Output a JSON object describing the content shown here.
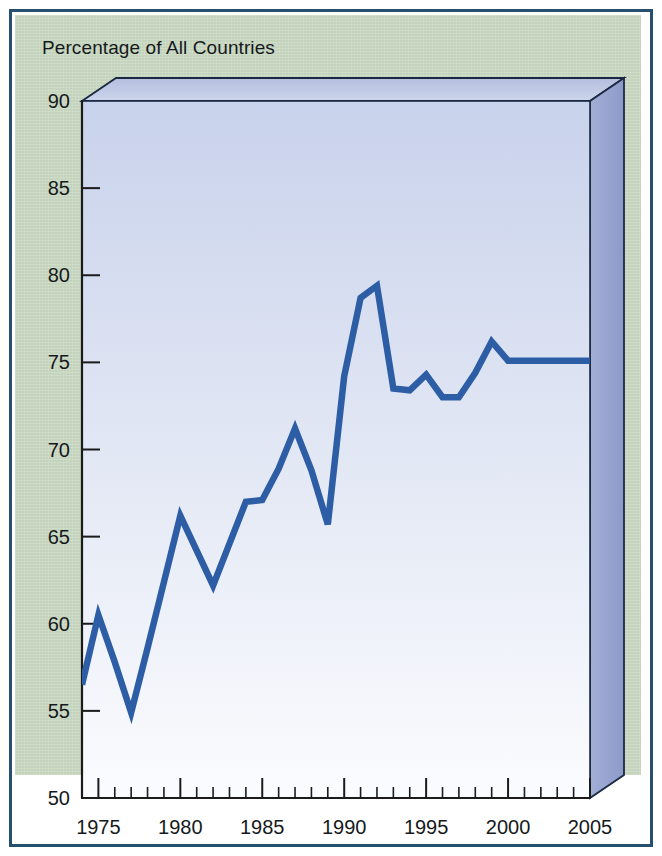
{
  "figure": {
    "title": "Percentage of All Countries",
    "panel_color": "#c3d3bb",
    "border_color": "#27506f",
    "plot_fill_top": "#ccd4ec",
    "plot_fill_bottom": "#fbfcfe",
    "side_panel_color": "#8e9bcb",
    "top_panel_color": "#b9c2e0",
    "line_color": "#2d5ea5"
  },
  "chart_data": {
    "type": "line",
    "title": "Percentage of All Countries",
    "xlabel": "",
    "ylabel": "Percentage of All Countries",
    "xlim": [
      1974,
      2005
    ],
    "ylim": [
      50,
      90
    ],
    "grid": false,
    "legend": null,
    "y_ticks": [
      50,
      55,
      60,
      65,
      70,
      75,
      80,
      85,
      90
    ],
    "y_tick_labels": [
      "50",
      "55",
      "60",
      "65",
      "70",
      "75",
      "80",
      "85",
      "90"
    ],
    "x_ticks_major": [
      1975,
      1980,
      1985,
      1990,
      1995,
      2000,
      2005
    ],
    "x_tick_labels": [
      "1975",
      "1980",
      "1985",
      "1990",
      "1995",
      "2000",
      "2005"
    ],
    "x_tick_minor_step": 1,
    "series": [
      {
        "name": "Percentage of All Countries",
        "color": "#2d5ea5",
        "x": [
          1974,
          1975,
          1976,
          1977,
          1978,
          1979,
          1980,
          1981,
          1982,
          1983,
          1984,
          1985,
          1986,
          1987,
          1988,
          1989,
          1990,
          1991,
          1992,
          1993,
          1994,
          1995,
          1996,
          1997,
          1998,
          1999,
          2000,
          2001,
          2002,
          2003,
          2004,
          2005
        ],
        "values": [
          56.5,
          60.5,
          57.8,
          54.9,
          58.6,
          62.4,
          66.2,
          64.2,
          62.2,
          64.6,
          67.0,
          67.1,
          68.9,
          71.2,
          68.8,
          65.7,
          74.2,
          78.7,
          79.4,
          73.5,
          73.4,
          74.3,
          73.0,
          73.0,
          74.4,
          76.2,
          75.1,
          75.1,
          75.1,
          75.1,
          75.1,
          75.1
        ]
      }
    ]
  }
}
